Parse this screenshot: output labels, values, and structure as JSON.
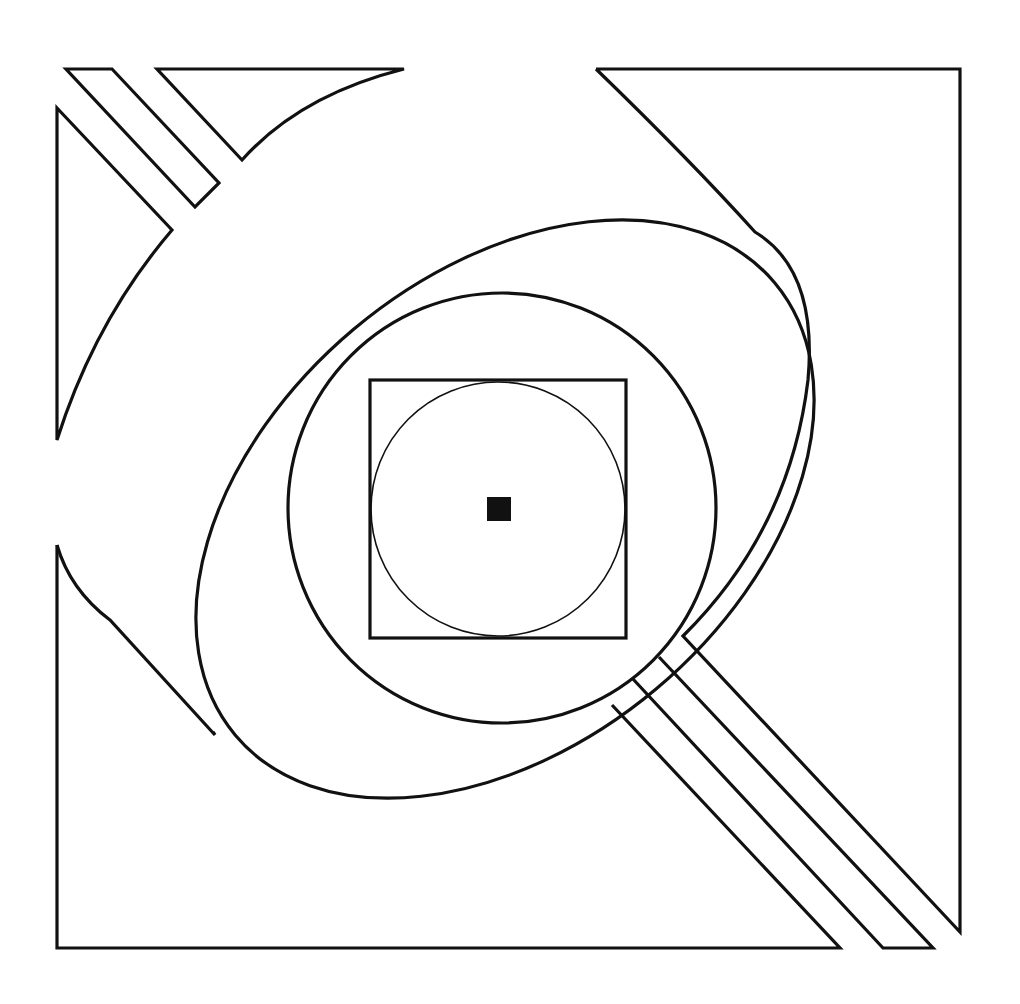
{
  "figure": {
    "colors": {
      "stroke": "#111111",
      "background": "#ffffff",
      "fill": "#111111"
    },
    "elements": [
      "outer-frame",
      "diagonal-stripes-top-left",
      "diagonal-stripes-bottom-right",
      "tilted-ellipse",
      "middle-ellipse",
      "inner-square",
      "inner-circle",
      "center-square"
    ]
  }
}
